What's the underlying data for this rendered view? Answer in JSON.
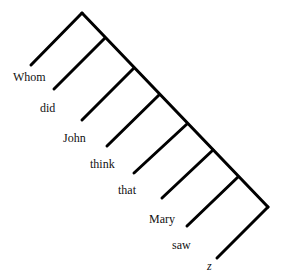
{
  "diagram": {
    "type": "syntax-tree",
    "style": {
      "line_color": "#000000",
      "line_width": 3,
      "text_color": "#111111"
    },
    "apex": [
      82,
      13
    ],
    "spine_end": [
      268,
      207
    ],
    "branches": [
      {
        "word": "Whom",
        "from": [
          82,
          13
        ],
        "to": [
          31,
          65
        ],
        "label_pos": [
          13,
          71
        ]
      },
      {
        "word": "did",
        "from": [
          105,
          38
        ],
        "to": [
          54,
          89
        ],
        "label_pos": [
          40,
          102
        ]
      },
      {
        "word": "John",
        "from": [
          134,
          68
        ],
        "to": [
          82,
          120
        ],
        "label_pos": [
          63,
          132
        ]
      },
      {
        "word": "think",
        "from": [
          159,
          95
        ],
        "to": [
          107,
          146
        ],
        "label_pos": [
          90,
          158
        ]
      },
      {
        "word": "that",
        "from": [
          187,
          124
        ],
        "to": [
          134,
          173
        ],
        "label_pos": [
          118,
          184
        ]
      },
      {
        "word": "Mary",
        "from": [
          213,
          150
        ],
        "to": [
          162,
          198
        ],
        "label_pos": [
          149,
          213
        ]
      },
      {
        "word": "saw",
        "from": [
          238,
          177
        ],
        "to": [
          187,
          226
        ],
        "label_pos": [
          172,
          239
        ]
      },
      {
        "word": "z",
        "from": [
          268,
          207
        ],
        "to": [
          217,
          258
        ],
        "label_pos": [
          207,
          260
        ],
        "italic": true
      }
    ]
  },
  "labels": {
    "whom": "Whom",
    "did": "did",
    "john": "John",
    "think": "think",
    "that": "that",
    "mary": "Mary",
    "saw": "saw",
    "z": "z"
  }
}
